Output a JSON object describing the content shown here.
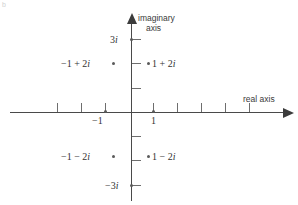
{
  "figure": {
    "corner_mark": "b",
    "axes": {
      "imaginary_label_line1": "imaginary",
      "imaginary_label_line2": "axis",
      "real_label": "real axis"
    },
    "axis_tick_labels": {
      "imag_top": "3i",
      "imag_bottom": "−3i",
      "real_neg_one": "−1",
      "real_pos_one": "1"
    },
    "points": [
      {
        "name": "point-neg1-plus-2i",
        "label": "−1 + 2i",
        "re": -1,
        "im": 2,
        "label_side": "left"
      },
      {
        "name": "point-pos1-plus-2i",
        "label": "1 + 2i",
        "re": 1,
        "im": 2,
        "label_side": "right"
      },
      {
        "name": "point-neg1-minus-2i",
        "label": "−1 − 2i",
        "re": -1,
        "im": -2,
        "label_side": "left"
      },
      {
        "name": "point-pos1-minus-2i",
        "label": "1 − 2i",
        "re": 1,
        "im": -2,
        "label_side": "right"
      }
    ]
  },
  "chart_data": {
    "type": "scatter",
    "title": "",
    "xlabel": "real axis",
    "ylabel": "imaginary axis",
    "xlim": [
      -5,
      6.5
    ],
    "ylim": [
      -3.5,
      3.4
    ],
    "grid": false,
    "legend": null,
    "xtick_labels": {
      "-1": "−1",
      "1": "1"
    },
    "ytick_labels": {
      "3": "3i",
      "-3": "−3i"
    },
    "xticks": [
      -3,
      -2,
      -1,
      1,
      2,
      3,
      4,
      5
    ],
    "yticks": [
      3,
      2,
      1,
      -1,
      -2,
      -3
    ],
    "points": [
      {
        "x": -1,
        "y": 2,
        "label": "−1 + 2i"
      },
      {
        "x": 1,
        "y": 2,
        "label": "1 + 2i"
      },
      {
        "x": -1,
        "y": -2,
        "label": "−1 − 2i"
      },
      {
        "x": 1,
        "y": -2,
        "label": "1 − 2i"
      },
      {
        "x": -1,
        "y": 0,
        "label": "−1"
      },
      {
        "x": 1,
        "y": 0,
        "label": "1"
      },
      {
        "x": 0,
        "y": 3,
        "label": "3i"
      },
      {
        "x": 0,
        "y": -3,
        "label": "−3i"
      }
    ],
    "colors": {
      "axis": "#4a4a4a",
      "point": "#5a5a5a",
      "text": "#333333"
    }
  }
}
